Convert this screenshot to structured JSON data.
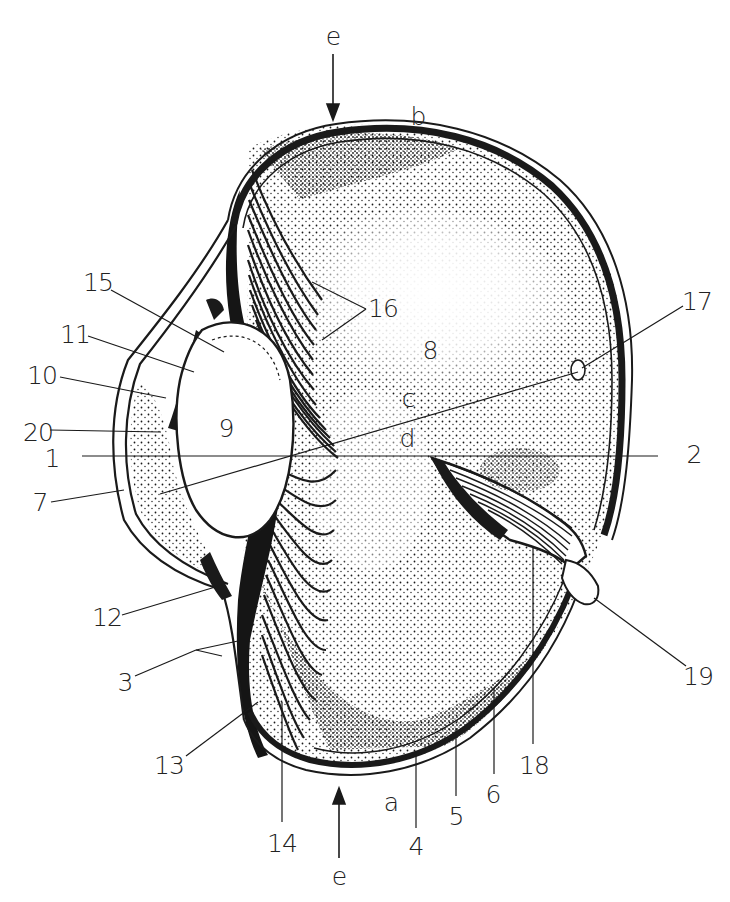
{
  "diagram": {
    "colors": {
      "ink": "#1a1a1a",
      "background": "#ffffff",
      "label": "#222222"
    },
    "axis_labels": [
      {
        "id": "1",
        "text": "1",
        "x": 52,
        "y": 458
      },
      {
        "id": "2",
        "text": "2",
        "x": 694,
        "y": 454
      }
    ],
    "letters": [
      {
        "id": "a",
        "text": "a",
        "x": 391,
        "y": 802
      },
      {
        "id": "b",
        "text": "b",
        "x": 418,
        "y": 116
      },
      {
        "id": "c",
        "text": "c",
        "x": 408,
        "y": 398
      },
      {
        "id": "d",
        "text": "d",
        "x": 407,
        "y": 438
      },
      {
        "id": "e_top",
        "text": "e",
        "x": 333,
        "y": 36
      },
      {
        "id": "e_bottom",
        "text": "e",
        "x": 339,
        "y": 876
      }
    ],
    "numbers": [
      {
        "id": "3",
        "text": "3",
        "x": 125,
        "y": 682
      },
      {
        "id": "4",
        "text": "4",
        "x": 416,
        "y": 846
      },
      {
        "id": "5",
        "text": "5",
        "x": 456,
        "y": 816
      },
      {
        "id": "6",
        "text": "6",
        "x": 493,
        "y": 794
      },
      {
        "id": "7",
        "text": "7",
        "x": 40,
        "y": 502
      },
      {
        "id": "8",
        "text": "8",
        "x": 430,
        "y": 350
      },
      {
        "id": "9",
        "text": "9",
        "x": 226,
        "y": 428
      },
      {
        "id": "10",
        "text": "10",
        "x": 42,
        "y": 375
      },
      {
        "id": "11",
        "text": "11",
        "x": 75,
        "y": 334
      },
      {
        "id": "12",
        "text": "12",
        "x": 107,
        "y": 617
      },
      {
        "id": "13",
        "text": "13",
        "x": 169,
        "y": 765
      },
      {
        "id": "14",
        "text": "14",
        "x": 282,
        "y": 843
      },
      {
        "id": "15",
        "text": "15",
        "x": 98,
        "y": 282
      },
      {
        "id": "16",
        "text": "16",
        "x": 383,
        "y": 308
      },
      {
        "id": "17",
        "text": "17",
        "x": 697,
        "y": 301
      },
      {
        "id": "18",
        "text": "18",
        "x": 534,
        "y": 765
      },
      {
        "id": "19",
        "text": "19",
        "x": 698,
        "y": 676
      },
      {
        "id": "20",
        "text": "20",
        "x": 38,
        "y": 432
      }
    ],
    "arrows": [
      {
        "id": "e_top_arrow",
        "direction": "down"
      },
      {
        "id": "e_bottom_arrow",
        "direction": "up"
      }
    ]
  }
}
